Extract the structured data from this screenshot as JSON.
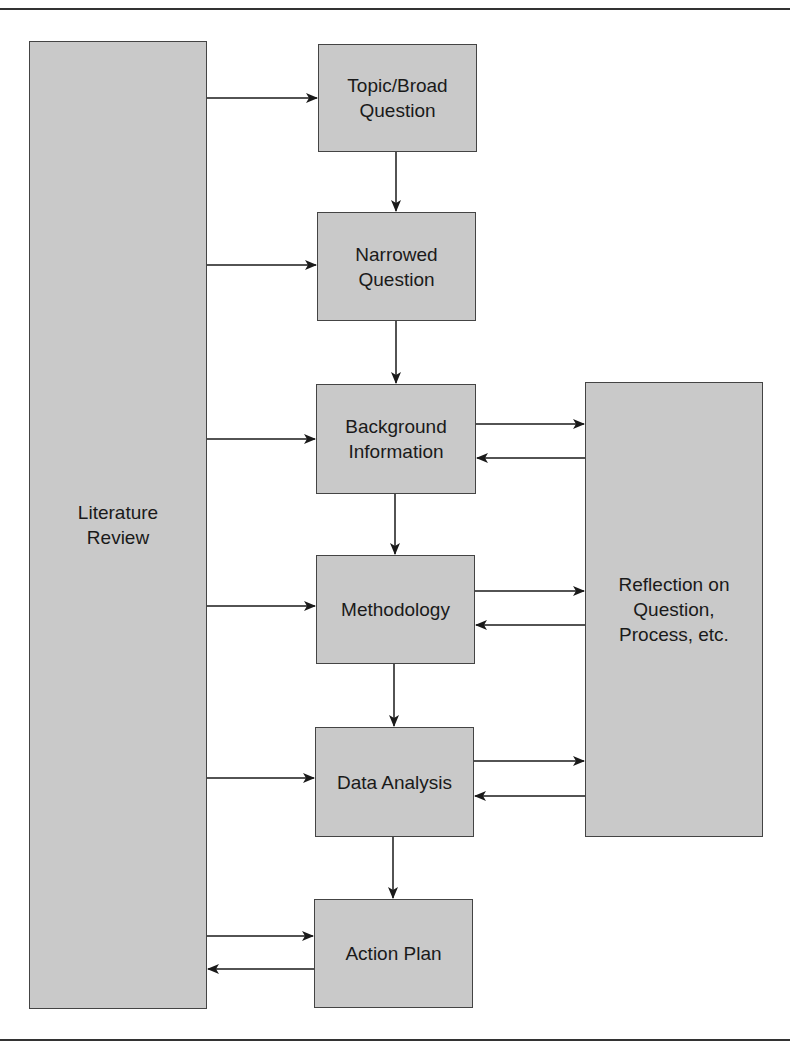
{
  "diagram": {
    "nodes": [
      {
        "id": "literature",
        "label": "Literature\nReview",
        "x": 29,
        "y": 41,
        "w": 178,
        "h": 968
      },
      {
        "id": "topic",
        "label": "Topic/Broad\nQuestion",
        "x": 318,
        "y": 44,
        "w": 159,
        "h": 108
      },
      {
        "id": "narrowed",
        "label": "Narrowed\nQuestion",
        "x": 317,
        "y": 212,
        "w": 159,
        "h": 109
      },
      {
        "id": "background",
        "label": "Background\nInformation",
        "x": 316,
        "y": 384,
        "w": 160,
        "h": 110
      },
      {
        "id": "methodology",
        "label": "Methodology",
        "x": 316,
        "y": 555,
        "w": 159,
        "h": 109
      },
      {
        "id": "data",
        "label": "Data Analysis",
        "x": 315,
        "y": 727,
        "w": 159,
        "h": 110
      },
      {
        "id": "action",
        "label": "Action Plan",
        "x": 314,
        "y": 899,
        "w": 159,
        "h": 109
      },
      {
        "id": "reflection",
        "label": "Reflection on\nQuestion,\nProcess, etc.",
        "x": 585,
        "y": 382,
        "w": 178,
        "h": 455
      }
    ],
    "edges": [
      {
        "from": "literature",
        "to": "topic"
      },
      {
        "from": "literature",
        "to": "narrowed"
      },
      {
        "from": "literature",
        "to": "background"
      },
      {
        "from": "literature",
        "to": "methodology"
      },
      {
        "from": "literature",
        "to": "data"
      },
      {
        "from": "literature",
        "to": "action"
      },
      {
        "from": "action",
        "to": "literature"
      },
      {
        "from": "topic",
        "to": "narrowed"
      },
      {
        "from": "narrowed",
        "to": "background"
      },
      {
        "from": "background",
        "to": "methodology"
      },
      {
        "from": "methodology",
        "to": "data"
      },
      {
        "from": "data",
        "to": "action"
      },
      {
        "from": "background",
        "to": "reflection"
      },
      {
        "from": "reflection",
        "to": "background"
      },
      {
        "from": "methodology",
        "to": "reflection"
      },
      {
        "from": "reflection",
        "to": "methodology"
      },
      {
        "from": "data",
        "to": "reflection"
      },
      {
        "from": "reflection",
        "to": "data"
      }
    ]
  }
}
